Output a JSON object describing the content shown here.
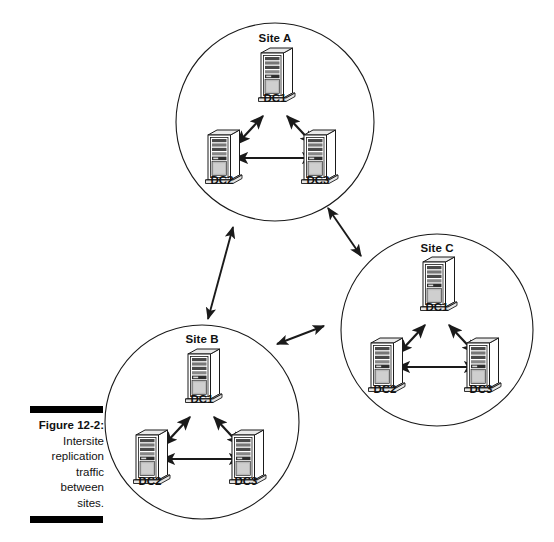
{
  "figure": {
    "caption_number": "Figure 12-2:",
    "caption_lines": [
      "Intersite",
      "replication",
      "traffic",
      "between",
      "sites."
    ]
  },
  "diagram": {
    "type": "network-topology",
    "background": "#ffffff",
    "line_color": "#1a1a1a",
    "sites": [
      {
        "id": "site-a",
        "title": "Site A",
        "cx": 275,
        "cy": 122,
        "r": 99,
        "title_x": 275,
        "title_y": 32,
        "servers": [
          {
            "id": "a-dc1",
            "label": "DC1",
            "x": 275,
            "y": 48,
            "label_x": 275,
            "label_y": 92
          },
          {
            "id": "a-dc2",
            "label": "DC2",
            "x": 222,
            "y": 130,
            "label_x": 222,
            "label_y": 174
          },
          {
            "id": "a-dc3",
            "label": "DC3",
            "x": 318,
            "y": 130,
            "label_x": 318,
            "label_y": 174
          }
        ]
      },
      {
        "id": "site-b",
        "title": "Site B",
        "cx": 202,
        "cy": 422,
        "r": 97,
        "title_x": 202,
        "title_y": 333,
        "servers": [
          {
            "id": "b-dc1",
            "label": "DC1",
            "x": 202,
            "y": 349,
            "label_x": 202,
            "label_y": 393
          },
          {
            "id": "b-dc2",
            "label": "DC2",
            "x": 150,
            "y": 430,
            "label_x": 150,
            "label_y": 475
          },
          {
            "id": "b-dc3",
            "label": "DC3",
            "x": 246,
            "y": 430,
            "label_x": 246,
            "label_y": 475
          }
        ]
      },
      {
        "id": "site-c",
        "title": "Site C",
        "cx": 437,
        "cy": 330,
        "r": 96,
        "title_x": 437,
        "title_y": 242,
        "servers": [
          {
            "id": "c-dc1",
            "label": "DC1",
            "x": 437,
            "y": 257,
            "label_x": 437,
            "label_y": 301
          },
          {
            "id": "c-dc2",
            "label": "DC2",
            "x": 385,
            "y": 338,
            "label_x": 385,
            "label_y": 383
          },
          {
            "id": "c-dc3",
            "label": "DC3",
            "x": 481,
            "y": 338,
            "label_x": 481,
            "label_y": 383
          }
        ]
      }
    ],
    "intersite_links": [
      {
        "id": "link-a-b",
        "from": "site-a",
        "to": "site-b",
        "x1": 233,
        "y1": 227,
        "x2": 208,
        "y2": 319
      },
      {
        "id": "link-a-c",
        "from": "site-a",
        "to": "site-c",
        "x1": 328,
        "y1": 208,
        "x2": 361,
        "y2": 256
      },
      {
        "id": "link-b-c",
        "from": "site-b",
        "to": "site-c",
        "x1": 277,
        "y1": 344,
        "x2": 324,
        "y2": 326
      }
    ]
  }
}
